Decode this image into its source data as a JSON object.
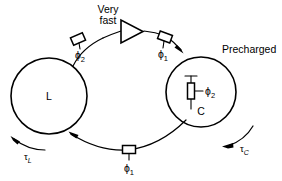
{
  "diagram": {
    "title_hidden": "",
    "nodes": {
      "left_circle_label": "L",
      "right_circle_label": "C"
    },
    "annotations": {
      "very_fast_line1": "Very",
      "very_fast_line2": "fast",
      "precharged": "Precharged"
    },
    "switches": [
      {
        "id": "top-left-switch",
        "phase_symbol": "ϕ",
        "phase_index": "2"
      },
      {
        "id": "top-right-switch",
        "phase_symbol": "ϕ",
        "phase_index": "1"
      },
      {
        "id": "capacitor-gate-switch",
        "phase_symbol": "ϕ",
        "phase_index": "2"
      },
      {
        "id": "bottom-switch",
        "phase_symbol": "ϕ",
        "phase_index": "1"
      }
    ],
    "delays": [
      {
        "id": "tau-L",
        "symbol": "τ",
        "subscript": "L"
      },
      {
        "id": "tau-C",
        "symbol": "τ",
        "subscript": "C"
      }
    ],
    "colors": {
      "stroke": "#000000",
      "background": "#ffffff",
      "text": "#000000"
    }
  }
}
